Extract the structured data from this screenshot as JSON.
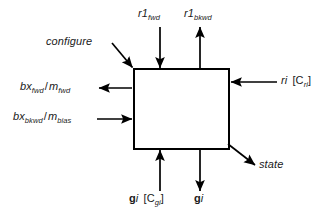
{
  "diagram": {
    "block": {
      "name": "central-block",
      "label": "",
      "x": 134,
      "y": 69,
      "width": 95,
      "height": 80,
      "stroke": "#000000",
      "fill": "#ffffff",
      "stroke_width": 2
    },
    "colors": {
      "line": "#000000",
      "text": "#1a1a1a",
      "background": "#ffffff"
    },
    "signals": [
      {
        "id": "configure",
        "label_text": "configure",
        "label_html": "configure",
        "style": "italic",
        "direction": "in",
        "side": "top-left-corner",
        "arrow_from": [
          113,
          44
        ],
        "arrow_to": [
          134,
          69
        ]
      },
      {
        "id": "r1-fwd",
        "label_text": "r1_fwd",
        "base": "r1",
        "subscript": "fwd",
        "style": "italic",
        "direction": "in",
        "side": "top",
        "arrow_from": [
          160,
          28
        ],
        "arrow_to": [
          160,
          69
        ]
      },
      {
        "id": "r1-bkwd",
        "label_text": "r1_bkwd",
        "base": "r1",
        "subscript": "bkwd",
        "style": "italic",
        "direction": "out",
        "side": "top",
        "arrow_from": [
          200,
          69
        ],
        "arrow_to": [
          200,
          28
        ]
      },
      {
        "id": "ri-cri",
        "label_text": "ri [Cri]",
        "base": "ri",
        "bracket": "[C",
        "subscript": "ri",
        "bracket_close": "]",
        "style": "italic",
        "direction": "in",
        "side": "right",
        "arrow_from": [
          275,
          82
        ],
        "arrow_to": [
          229,
          82
        ]
      },
      {
        "id": "bx-fwd-m-fwd",
        "label_text": "bx_fwd / m_fwd",
        "base1": "bx",
        "subscript1": "fwd",
        "separator": "/",
        "base2": "m",
        "subscript2": "fwd",
        "style": "italic",
        "direction": "out",
        "side": "left",
        "arrow_from": [
          134,
          88
        ],
        "arrow_to": [
          100,
          88
        ]
      },
      {
        "id": "bx-bkwd-m-bias",
        "label_text": "bx_bkwd / m_bias",
        "base1": "bx",
        "subscript1": "bkwd",
        "separator": "/",
        "base2": "m",
        "subscript2": "bias",
        "style": "italic",
        "direction": "in",
        "side": "left",
        "arrow_from": [
          100,
          119
        ],
        "arrow_to": [
          134,
          119
        ]
      },
      {
        "id": "state",
        "label_text": "state",
        "style": "italic",
        "direction": "out",
        "side": "bottom-right-corner",
        "arrow_from": [
          229,
          145
        ],
        "arrow_to": [
          256,
          166
        ]
      },
      {
        "id": "gi-cgi",
        "label_text": "gi [Cgi]",
        "base_bold": "g",
        "base_italic": "i",
        "bracket": "[C",
        "subscript": "gi",
        "bracket_close": "]",
        "style": "bold-italic",
        "direction": "in",
        "side": "bottom",
        "arrow_from": [
          160,
          190
        ],
        "arrow_to": [
          160,
          149
        ]
      },
      {
        "id": "gi",
        "label_text": "gi",
        "base_bold": "g",
        "base_italic": "i",
        "style": "bold-italic",
        "direction": "out",
        "side": "bottom",
        "arrow_from": [
          200,
          149
        ],
        "arrow_to": [
          200,
          190
        ]
      }
    ]
  }
}
